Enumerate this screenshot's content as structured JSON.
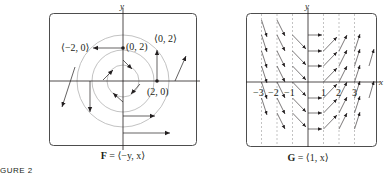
{
  "figure_label": "GURE 2",
  "left_panel": {
    "caption_bold": "F",
    "caption_rest": " = ⟨−y, x⟩",
    "axis_x_label": "x",
    "axis_y_label": "y",
    "annotations": [
      {
        "text": "⟨−2, 0⟩",
        "x": 58,
        "y": 50
      },
      {
        "text": "(0, 2)",
        "x": 127,
        "y": 47
      },
      {
        "text": "⟨0, 2⟩",
        "x": 154,
        "y": 41
      },
      {
        "text": "(2, 0)",
        "x": 147,
        "y": 93
      }
    ],
    "points": [
      {
        "label": "(0, 2)",
        "cx": 123,
        "cy": 50
      },
      {
        "label": "(2, 0)",
        "cx": 157,
        "cy": 81
      }
    ],
    "circle_radii": [
      16,
      31,
      46
    ]
  },
  "right_panel": {
    "caption_bold": "G",
    "caption_rest": " = ⟨1, x⟩",
    "axis_x_label": "x",
    "axis_y_label": "y",
    "tick_labels": [
      "−3",
      "−2",
      "−1",
      "1",
      "2",
      "3"
    ],
    "tick_values": [
      -3,
      -2,
      -1,
      1,
      2,
      3
    ]
  },
  "colors": {
    "ink": "#231f20",
    "circle": "#b3b3b3",
    "dashed": "#9a9a9a",
    "frame": "#4d4d4d"
  }
}
